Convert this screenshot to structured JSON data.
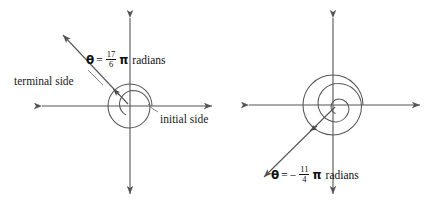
{
  "figure": {
    "background_color": "#ffffff",
    "line_color": "#555555",
    "text_color": "#1a1a1a",
    "width": 435,
    "height": 212
  },
  "panels": [
    {
      "id": "left-panel",
      "name": "positive-angle-diagram",
      "origin": {
        "x": 130,
        "y": 106
      },
      "axes": {
        "x_axis": {
          "x1": 38,
          "y1": 106,
          "x2": 215,
          "y2": 106,
          "arrows": "both"
        },
        "y_axis": {
          "x1": 130,
          "y1": 14,
          "x2": 130,
          "y2": 198,
          "arrows": "both"
        }
      },
      "equation": {
        "theta": "θ",
        "equals": "=",
        "sign": "",
        "numerator": "17",
        "denominator": "6",
        "pi": "π",
        "unit": "radians",
        "plain_text": "θ = 17/6 π radians"
      },
      "labels": [
        {
          "name": "terminal-side-label",
          "text": "terminal side",
          "x": 14,
          "y": 76
        },
        {
          "name": "initial-side-label",
          "text": "initial side",
          "x": 160,
          "y": 114
        }
      ],
      "terminal_ray": {
        "angle_degrees": 150,
        "from": {
          "x": 130,
          "y": 106
        },
        "to": {
          "x": 61,
          "y": 33
        },
        "arrow": "tip"
      },
      "spiral": {
        "turns": 1.42,
        "description": "one full revolution plus 150 degrees",
        "outer_radius": 22,
        "inner_radius": 11
      }
    },
    {
      "id": "right-panel",
      "name": "negative-angle-diagram",
      "origin": {
        "x": 333,
        "y": 105
      },
      "axes": {
        "x_axis": {
          "x1": 245,
          "y1": 105,
          "x2": 424,
          "y2": 105,
          "arrows": "both"
        },
        "y_axis": {
          "x1": 333,
          "y1": 14,
          "x2": 333,
          "y2": 198,
          "arrows": "both"
        }
      },
      "equation": {
        "theta": "θ",
        "equals": "=",
        "sign": "−",
        "numerator": "11",
        "denominator": "4",
        "pi": "π",
        "unit": "radians",
        "plain_text": "θ = − 11/4 π radians"
      },
      "labels": [],
      "terminal_ray": {
        "angle_degrees": -135,
        "from": {
          "x": 333,
          "y": 105
        },
        "to": {
          "x": 263,
          "y": 176
        },
        "arrow": "tip"
      },
      "spiral": {
        "turns": 1.375,
        "description": "one full clockwise revolution plus 135 degrees",
        "outer_radius": 30,
        "inner_radius": 8
      }
    }
  ]
}
